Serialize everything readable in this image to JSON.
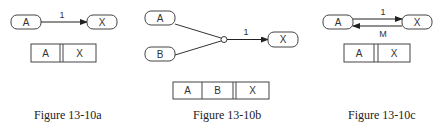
{
  "figures": [
    {
      "id": "a",
      "caption": "Figure 13-10a",
      "nodes": {
        "source": "A",
        "target": "X"
      },
      "edge_label": "1",
      "record": [
        "A",
        "X"
      ]
    },
    {
      "id": "b",
      "caption": "Figure 13-10b",
      "nodes": {
        "source1": "A",
        "source2": "B",
        "target": "X"
      },
      "edge_label": "1",
      "record": [
        "A",
        "B",
        "X"
      ]
    },
    {
      "id": "c",
      "caption": "Figure 13-10c",
      "nodes": {
        "source": "A",
        "target": "X"
      },
      "edge_label_forward": "1",
      "edge_label_back": "M",
      "record": [
        "A",
        "X"
      ]
    }
  ],
  "colors": {
    "ink": "#333333",
    "background": "#ffffff"
  }
}
